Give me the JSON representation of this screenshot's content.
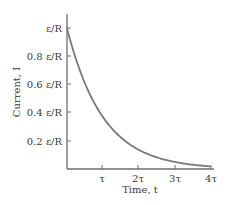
{
  "chart_data": {
    "type": "line",
    "title": "",
    "xlabel": "Time, t",
    "ylabel": "Current, I",
    "x_ticks": [
      "τ",
      "2τ",
      "3τ",
      "4τ"
    ],
    "y_ticks": [
      "0.2 ε/R",
      "0.4 ε/R",
      "0.6 ε/R",
      "0.8 ε/R",
      "ε/R"
    ],
    "xlim": [
      0,
      4
    ],
    "ylim": [
      0,
      1.0
    ],
    "grid": false,
    "legend": null,
    "series": [
      {
        "name": "I(t) = (ε/R) e^(-t/τ)",
        "x": [
          0,
          0.25,
          0.5,
          0.75,
          1,
          1.5,
          2,
          2.5,
          3,
          3.5,
          4
        ],
        "values": [
          1.0,
          0.779,
          0.607,
          0.472,
          0.368,
          0.223,
          0.135,
          0.082,
          0.05,
          0.03,
          0.018
        ]
      }
    ],
    "colors": {
      "curve": "#7a7a7a",
      "axis": "#6e6e6e",
      "text": "#3a3a3a"
    }
  },
  "labels": {
    "y": [
      "ε/R",
      "0.8 ε/R",
      "0.6 ε/R",
      "0.4 ε/R",
      "0.2 ε/R"
    ],
    "x": [
      "τ",
      "2τ",
      "3τ",
      "4τ"
    ],
    "xaxis": "Time, t",
    "yaxis": "Current, I"
  }
}
